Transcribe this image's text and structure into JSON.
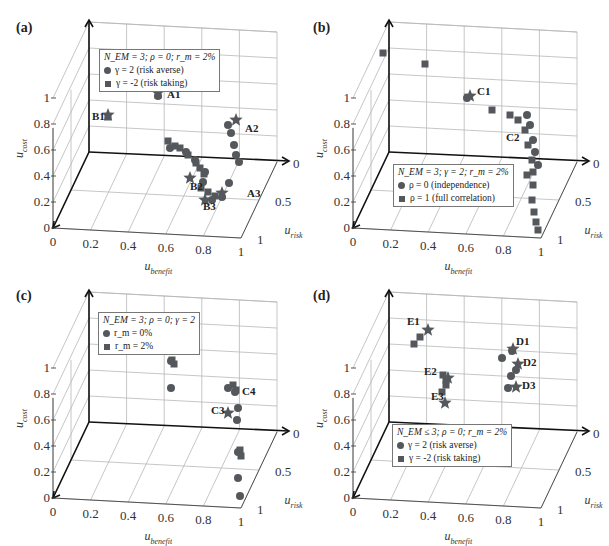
{
  "panels": [
    {
      "id": "a",
      "label": "(a)",
      "legend": {
        "title": "N_EM = 3; ρ = 0; r_m = 2%",
        "items": [
          "γ = 2 (risk averse)",
          "γ = -2 (risk taking)"
        ]
      }
    },
    {
      "id": "b",
      "label": "(b)",
      "legend": {
        "title": "N_EM = 3; γ = 2; r_m = 2%",
        "items": [
          "ρ = 0 (independence)",
          "ρ = 1 (full correlation)"
        ]
      }
    },
    {
      "id": "c",
      "label": "(c)",
      "legend": {
        "title": "N_EM = 3; ρ = 0; γ = 2",
        "items": [
          "r_m = 0%",
          "r_m = 2%"
        ]
      }
    },
    {
      "id": "d",
      "label": "(d)",
      "legend": {
        "title": "N_EM ≤ 3; ρ = 0; r_m = 2%",
        "items": [
          "γ = 2 (risk averse)",
          "γ = -2 (risk taking)"
        ]
      }
    }
  ],
  "axes": {
    "x_label": "u",
    "x_sub": "benefit",
    "y_label": "u",
    "y_sub": "risk",
    "z_label": "u",
    "z_sub": "cost",
    "x_ticks": [
      "0",
      "0.2",
      "0.4",
      "0.6",
      "0.8",
      "1"
    ],
    "y_ticks": [
      "0",
      "0.5",
      "1"
    ],
    "z_ticks": [
      "0",
      "0.2",
      "0.4",
      "0.6",
      "0.8",
      "1"
    ]
  },
  "chart_data": [
    {
      "type": "scatter",
      "title": "(a)",
      "dims": "3d",
      "xlabel": "u_benefit",
      "ylabel": "u_risk",
      "zlabel": "u_cost",
      "xlim": [
        0,
        1
      ],
      "ylim": [
        0,
        1
      ],
      "zlim": [
        0,
        1
      ],
      "legend": [
        "γ = 2 (risk averse)",
        "γ = -2 (risk taking)"
      ],
      "legend_title": "N_EM = 3; ρ = 0; r_m = 2%",
      "annotations": [
        {
          "label": "A1",
          "x": 0.45,
          "y": 0.0,
          "z": 1.2
        },
        {
          "label": "A2",
          "x": 0.85,
          "y": 0.05,
          "z": 0.85
        },
        {
          "label": "A3",
          "x": 0.95,
          "y": 0.5,
          "z": 0.3
        },
        {
          "label": "B1",
          "x": 0.0,
          "y": 0.0,
          "z": 0.9
        },
        {
          "label": "B2",
          "x": 0.75,
          "y": 0.4,
          "z": 0.35
        },
        {
          "label": "B3",
          "x": 0.85,
          "y": 0.6,
          "z": 0.3
        }
      ],
      "series": [
        {
          "name": "γ = 2 (risk averse)",
          "marker": "circle",
          "points_2d": [
            [
              158,
              96
            ],
            [
              228,
              125
            ],
            [
              231,
              133
            ],
            [
              234,
              145
            ],
            [
              236,
              155
            ],
            [
              239,
              162
            ],
            [
              229,
              183
            ],
            [
              222,
              197
            ],
            [
              212,
              200
            ],
            [
              170,
              148
            ],
            [
              186,
              152
            ],
            [
              195,
              160
            ],
            [
              205,
              172
            ],
            [
              203,
              182
            ]
          ]
        },
        {
          "name": "γ = -2 (risk taking)",
          "marker": "square",
          "points_2d": [
            [
              108,
              117
            ],
            [
              168,
              141
            ],
            [
              175,
              146
            ],
            [
              180,
              148
            ],
            [
              188,
              155
            ],
            [
              196,
              163
            ],
            [
              200,
              168
            ],
            [
              204,
              174
            ],
            [
              201,
              188
            ],
            [
              208,
              192
            ],
            [
              215,
              196
            ]
          ]
        }
      ]
    },
    {
      "type": "scatter",
      "title": "(b)",
      "dims": "3d",
      "xlabel": "u_benefit",
      "ylabel": "u_risk",
      "zlabel": "u_cost",
      "xlim": [
        0,
        1
      ],
      "ylim": [
        0,
        1
      ],
      "zlim": [
        0,
        1
      ],
      "legend": [
        "ρ = 0 (independence)",
        "ρ = 1 (full correlation)"
      ],
      "legend_title": "N_EM = 3; γ = 2; r_m = 2%",
      "annotations": [
        {
          "label": "C1",
          "x": 0.4,
          "y": 0.0,
          "z": 1.2
        },
        {
          "label": "C2",
          "x": 0.85,
          "y": 0.1,
          "z": 0.7
        }
      ],
      "series": [
        {
          "name": "ρ = 0 (independence)",
          "marker": "circle",
          "points_2d": [
            [
              167,
              98
            ],
            [
              227,
              115
            ],
            [
              230,
              125
            ],
            [
              233,
              140
            ],
            [
              235,
              152
            ],
            [
              238,
              165
            ]
          ]
        },
        {
          "name": "ρ = 1 (full correlation)",
          "marker": "square",
          "points_2d": [
            [
              83,
              53
            ],
            [
              125,
              64
            ],
            [
              192,
              110
            ],
            [
              210,
              115
            ],
            [
              218,
              120
            ],
            [
              225,
              130
            ],
            [
              228,
              145
            ],
            [
              232,
              160
            ],
            [
              233,
              172
            ],
            [
              227,
              175
            ],
            [
              233,
              185
            ],
            [
              232,
              200
            ],
            [
              234,
              212
            ],
            [
              236,
              222
            ],
            [
              238,
              230
            ]
          ]
        }
      ]
    },
    {
      "type": "scatter",
      "title": "(c)",
      "dims": "3d",
      "xlabel": "u_benefit",
      "ylabel": "u_risk",
      "zlabel": "u_cost",
      "xlim": [
        0,
        1
      ],
      "ylim": [
        0,
        1
      ],
      "zlim": [
        0,
        1
      ],
      "legend": [
        "r_m = 0%",
        "r_m = 2%"
      ],
      "legend_title": "N_EM = 3; ρ = 0; γ = 2",
      "annotations": [
        {
          "label": "C3",
          "x": 0.95,
          "y": 0.05,
          "z": 0.6
        },
        {
          "label": "C4",
          "x": 0.97,
          "y": 0.0,
          "z": 0.8
        }
      ],
      "series": [
        {
          "name": "r_m = 0%",
          "marker": "circle",
          "points_2d": [
            [
              171,
              91
            ],
            [
              171,
              118
            ],
            [
              228,
              118
            ],
            [
              235,
              122
            ],
            [
              238,
              138
            ],
            [
              237,
              150
            ],
            [
              238,
              182
            ],
            [
              238,
              208
            ],
            [
              240,
              226
            ]
          ]
        },
        {
          "name": "r_m = 2%",
          "marker": "square",
          "points_2d": [
            [
              172,
              90
            ],
            [
              174,
              94
            ],
            [
              233,
              115
            ],
            [
              236,
              120
            ],
            [
              240,
              180
            ],
            [
              241,
              186
            ]
          ]
        }
      ]
    },
    {
      "type": "scatter",
      "title": "(d)",
      "dims": "3d",
      "xlabel": "u_benefit",
      "ylabel": "u_risk",
      "zlabel": "u_cost",
      "xlim": [
        0,
        1
      ],
      "ylim": [
        0,
        1
      ],
      "zlim": [
        0,
        1
      ],
      "legend": [
        "γ = 2 (risk averse)",
        "γ = -2 (risk taking)"
      ],
      "legend_title": "N_EM ≤ 3; ρ = 0; r_m = 2%",
      "annotations": [
        {
          "label": "E1",
          "x": 0.1,
          "y": 0.0,
          "z": 1.4
        },
        {
          "label": "E2",
          "x": 0.2,
          "y": 0.0,
          "z": 1.0
        },
        {
          "label": "E3",
          "x": 0.25,
          "y": 0.0,
          "z": 0.8
        },
        {
          "label": "D1",
          "x": 0.8,
          "y": 0.0,
          "z": 1.15
        },
        {
          "label": "D2",
          "x": 0.85,
          "y": 0.0,
          "z": 1.0
        },
        {
          "label": "D3",
          "x": 0.85,
          "y": 0.0,
          "z": 0.85
        }
      ],
      "series": [
        {
          "name": "γ = 2 (risk averse)",
          "marker": "circle",
          "points_2d": [
            [
              202,
              88
            ],
            [
              212,
              81
            ],
            [
              216,
              100
            ],
            [
              211,
              106
            ],
            [
              208,
              118
            ]
          ]
        },
        {
          "name": "γ = -2 (risk taking)",
          "marker": "square",
          "points_2d": [
            [
              120,
              67
            ],
            [
              114,
              74
            ],
            [
              143,
              105
            ],
            [
              146,
              110
            ],
            [
              146,
              115
            ],
            [
              142,
              122
            ]
          ]
        }
      ],
      "stars_2d": [
        [
          128,
          60
        ],
        [
          213,
          79
        ],
        [
          218,
          94
        ],
        [
          216,
          117
        ],
        [
          148,
          108
        ],
        [
          145,
          133
        ]
      ]
    }
  ],
  "stars": {
    "a": [
      [
        158,
        93
      ],
      [
        108,
        115
      ],
      [
        236,
        120
      ],
      [
        222,
        193
      ],
      [
        205,
        200
      ],
      [
        190,
        178
      ]
    ],
    "b": [
      [
        170,
        96
      ]
    ],
    "c": [
      [
        228,
        143
      ]
    ],
    "d": [
      [
        128,
        60
      ],
      [
        213,
        79
      ],
      [
        218,
        94
      ],
      [
        216,
        117
      ],
      [
        148,
        108
      ],
      [
        145,
        133
      ]
    ]
  }
}
